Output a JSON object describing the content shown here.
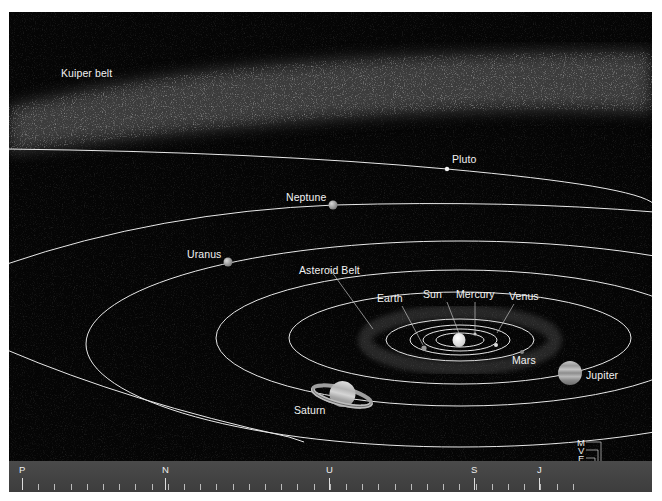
{
  "colors": {
    "background": "#050505",
    "orbit_line": "#e8e8e8",
    "label_text": "#f2f2f2",
    "scale_bar": "#444444",
    "page_border": "#ffffff"
  },
  "labels": {
    "kuiper_belt": "Kuiper belt",
    "pluto": "Pluto",
    "neptune": "Neptune",
    "uranus": "Uranus",
    "asteroid_belt": "Asteroid Belt",
    "earth": "Earth",
    "sun": "Sun",
    "mercury": "Mercury",
    "venus": "Venus",
    "mars": "Mars",
    "jupiter": "Jupiter",
    "saturn": "Saturn"
  },
  "scale_bar": {
    "markers": [
      {
        "letter": "P",
        "name": "Pluto"
      },
      {
        "letter": "N",
        "name": "Neptune"
      },
      {
        "letter": "U",
        "name": "Uranus"
      },
      {
        "letter": "S",
        "name": "Saturn"
      },
      {
        "letter": "J",
        "name": "Jupiter"
      }
    ],
    "inner_legend": [
      {
        "letter": "M",
        "name": "Mars"
      },
      {
        "letter": "V",
        "name": "Venus"
      },
      {
        "letter": "E",
        "name": "Earth"
      },
      {
        "letter": "M",
        "name": "Mercury"
      }
    ],
    "sun_label": "SUN"
  }
}
